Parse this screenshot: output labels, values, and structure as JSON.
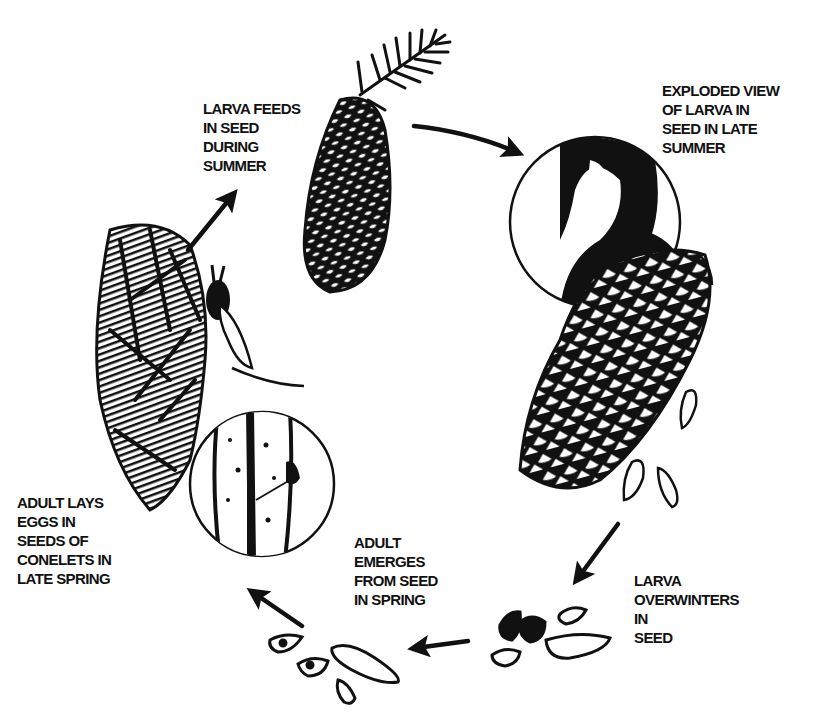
{
  "diagram": {
    "title": "",
    "type": "life-cycle",
    "colors": {
      "ink": "#111111",
      "background": "#ffffff"
    },
    "stages": [
      {
        "id": "larva-feeds",
        "lines": [
          "LARVA FEEDS",
          "IN SEED",
          "DURING",
          "SUMMER"
        ]
      },
      {
        "id": "exploded-view",
        "lines": [
          "EXPLODED VIEW",
          "OF LARVA IN",
          "SEED IN LATE",
          "SUMMER"
        ]
      },
      {
        "id": "larva-overwinters",
        "lines": [
          "LARVA",
          "OVERWINTERS",
          "IN",
          "SEED"
        ]
      },
      {
        "id": "adult-emerges",
        "lines": [
          "ADULT",
          "EMERGES",
          "FROM SEED",
          "IN SPRING"
        ]
      },
      {
        "id": "adult-lays-eggs",
        "lines": [
          "ADULT LAYS",
          "EGGS IN",
          "SEEDS OF",
          "CONELETS IN",
          "LATE SPRING"
        ]
      }
    ],
    "illustrations": [
      {
        "name": "spruce-cone-with-shoot",
        "description": "young cone on spruce shoot"
      },
      {
        "name": "magnified-seed-larva",
        "description": "circular magnified view of larva inside seed"
      },
      {
        "name": "mature-open-cone",
        "description": "mature cone shedding seeds"
      },
      {
        "name": "seeds-with-larvae",
        "description": "fallen seeds overwintering"
      },
      {
        "name": "empty-seeds-emergence-holes",
        "description": "seeds with emergence holes"
      },
      {
        "name": "conelet-with-adult",
        "description": "conelet bracts with adult insect laying eggs"
      },
      {
        "name": "magnified-ovipositor",
        "description": "circular magnified view of ovipositor in seed"
      }
    ],
    "arrows": [
      {
        "name": "arrow-cone-to-exploded",
        "direction": "right-down"
      },
      {
        "name": "arrow-cone-to-seeds",
        "direction": "down-left"
      },
      {
        "name": "arrow-seeds-to-emergence",
        "direction": "left"
      },
      {
        "name": "arrow-emergence-to-conelet",
        "direction": "up-left"
      },
      {
        "name": "arrow-conelet-to-cone",
        "direction": "up-right"
      }
    ]
  }
}
